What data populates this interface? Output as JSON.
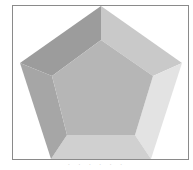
{
  "figure": {
    "colors": {
      "face_top": "#b3b3b3",
      "facet_upper_left": "#999999",
      "facet_upper_right": "#c8c8c8",
      "facet_right": "#e2e2e2",
      "facet_bottom": "#cfcfcf",
      "facet_left": "#a3a3a3",
      "frame": "#8a8a8a"
    },
    "outer_vertices": [
      [
        101,
        6
      ],
      [
        182,
        63
      ],
      [
        151,
        159
      ],
      [
        51,
        159
      ],
      [
        20,
        63
      ]
    ],
    "inner_vertices": [
      [
        101,
        40
      ],
      [
        153,
        76
      ],
      [
        135,
        135
      ],
      [
        67,
        135
      ],
      [
        52,
        76
      ]
    ],
    "caption": "· · · · · ·"
  }
}
